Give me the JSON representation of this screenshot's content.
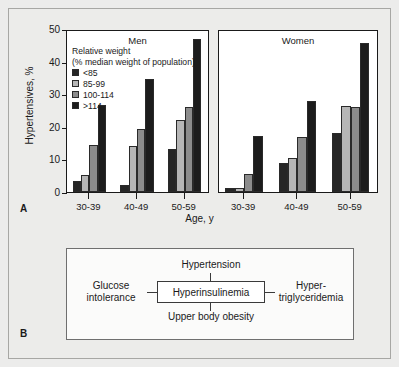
{
  "figure": {
    "panel_a_letter": "A",
    "panel_b_letter": "B"
  },
  "chart_data": {
    "type": "bar",
    "title": "",
    "xlabel": "Age, y",
    "ylabel": "Hypertensives, %",
    "ylim": [
      0,
      50
    ],
    "yticks": [
      "0",
      "10",
      "20",
      "30",
      "40",
      "50"
    ],
    "grid": false,
    "legend_position": "upper-left-inside",
    "legend_title": "Relative weight",
    "legend_subtitle": "(% median weight of population)",
    "categories": [
      "30-39",
      "40-49",
      "50-59"
    ],
    "panels": [
      {
        "name": "Men",
        "series": [
          {
            "name": "<85",
            "values": [
              3.5,
              2.3,
              13.2
            ]
          },
          {
            "name": "85-99",
            "values": [
              5.2,
              14.0,
              22.0
            ]
          },
          {
            "name": "100-114",
            "values": [
              14.4,
              19.4,
              26.0
            ]
          },
          {
            "name": ">114",
            "values": [
              26.8,
              34.8,
              47.0
            ]
          }
        ]
      },
      {
        "name": "Women",
        "series": [
          {
            "name": "<85",
            "values": [
              1.2,
              8.9,
              18.1
            ]
          },
          {
            "name": "85-99",
            "values": [
              1.3,
              10.4,
              26.5
            ]
          },
          {
            "name": "100-114",
            "values": [
              5.6,
              17.0,
              26.0
            ]
          },
          {
            "name": ">114",
            "values": [
              17.3,
              27.9,
              45.7
            ]
          }
        ]
      }
    ],
    "series_colors": [
      "#262626",
      "#b6b6b6",
      "#8c8c8c",
      "#1c1c1c"
    ]
  },
  "diagram": {
    "center": "Hyperinsulinemia",
    "top": "Hypertension",
    "bottom": "Upper body obesity",
    "left": "Glucose\nintolerance",
    "left_line1": "Glucose",
    "left_line2": "intolerance",
    "right_line1": "Hyper-",
    "right_line2": "triglyceridemia"
  }
}
